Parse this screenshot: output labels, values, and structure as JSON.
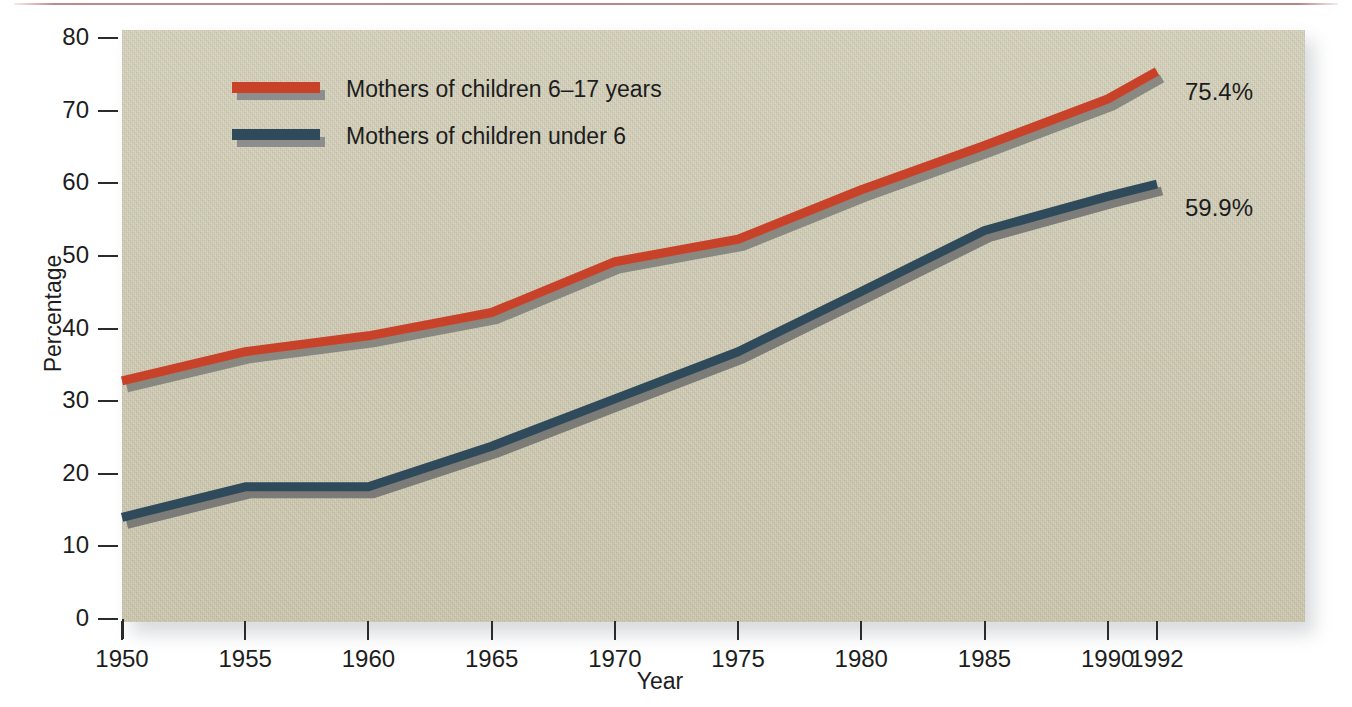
{
  "chart_data": {
    "type": "line",
    "title": "",
    "xlabel": "Year",
    "ylabel": "Percentage",
    "xlim": [
      1950,
      1992
    ],
    "ylim": [
      0,
      80
    ],
    "grid": false,
    "legend_position": "upper-left-inside",
    "xticks": [
      1950,
      1955,
      1960,
      1965,
      1970,
      1975,
      1980,
      1985,
      1990,
      1992
    ],
    "xticklabels": [
      "1950",
      "1955",
      "1960",
      "1965",
      "1970",
      "1975",
      "1980",
      "1985",
      "1990",
      "1992"
    ],
    "yticks": [
      0,
      10,
      20,
      30,
      40,
      50,
      60,
      70,
      80
    ],
    "yticklabels": [
      "0",
      "10",
      "20",
      "30",
      "40",
      "50",
      "60",
      "70",
      "80"
    ],
    "series": [
      {
        "name": "Mothers of children 6–17 years",
        "color": "#c8422a",
        "shadow_color": "#7c7c78",
        "end_label": "75.4%",
        "x": [
          1950,
          1955,
          1960,
          1965,
          1970,
          1975,
          1980,
          1985,
          1990,
          1992
        ],
        "values": [
          32.8,
          36.8,
          39.0,
          42.2,
          49.2,
          52.3,
          59.1,
          65.2,
          71.6,
          75.4
        ]
      },
      {
        "name": "Mothers of children under 6",
        "color": "#2f4a5a",
        "shadow_color": "#6f6f6d",
        "end_label": "59.9%",
        "x": [
          1950,
          1955,
          1960,
          1965,
          1970,
          1975,
          1980,
          1985,
          1990,
          1992
        ],
        "values": [
          14.0,
          18.2,
          18.2,
          23.8,
          30.3,
          36.8,
          45.1,
          53.5,
          58.2,
          59.9
        ]
      }
    ]
  },
  "axes": {
    "ylabel": "Percentage",
    "xlabel": "Year"
  },
  "legend": {
    "items": [
      {
        "label": "Mothers of children 6–17 years",
        "color": "#c8422a"
      },
      {
        "label": "Mothers of children under 6",
        "color": "#2f4a5a"
      }
    ]
  },
  "end_labels": {
    "upper": "75.4%",
    "lower": "59.9%"
  },
  "colors": {
    "series_red": "#c8422a",
    "series_blue": "#2f4a5a",
    "panel_background": "#cdc8b0",
    "shadow": "#8d8d8d",
    "text": "#1d1d1d",
    "top_rule": "#b07676"
  }
}
